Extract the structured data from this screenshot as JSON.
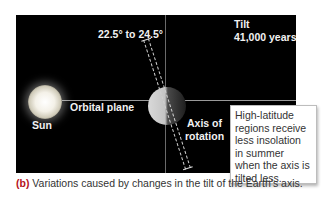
{
  "diagram": {
    "tilt_range_label": "22.5° to 24.5°",
    "cycle_title": "Tilt",
    "cycle_period": "41,000 years",
    "sun_label": "Sun",
    "orbital_plane_label": "Orbital plane",
    "axis_label_line1": "Axis of",
    "axis_label_line2": "rotation",
    "callout_text": "High-latitude regions receive less insolation in summer when the axis is tilted less."
  },
  "caption": {
    "marker": "(b)",
    "text": " Variations caused by changes in the tilt of the Earth's axis."
  },
  "colors": {
    "panel_bg": "#000000",
    "caption_marker": "#b5121b"
  }
}
